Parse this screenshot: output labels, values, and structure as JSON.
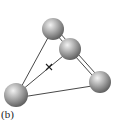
{
  "figure": {
    "label": "(b)",
    "atoms": [
      {
        "id": "top",
        "cx": 53,
        "cy": 29,
        "r": 11
      },
      {
        "id": "middle",
        "cx": 70,
        "cy": 49,
        "r": 11
      },
      {
        "id": "right",
        "cx": 100,
        "cy": 82,
        "r": 11
      },
      {
        "id": "bottom-left",
        "cx": 16,
        "cy": 95,
        "r": 12
      }
    ],
    "bonds": [
      {
        "from": "top",
        "to": "bottom-left",
        "type": "single"
      },
      {
        "from": "top",
        "to": "middle",
        "type": "double"
      },
      {
        "from": "middle",
        "to": "right",
        "type": "double"
      },
      {
        "from": "bottom-left",
        "to": "right",
        "type": "single"
      },
      {
        "from": "bottom-left",
        "to": "middle",
        "type": "single"
      }
    ],
    "center_marker": {
      "symbol": "x",
      "x": 49,
      "y": 67
    },
    "colors": {
      "bond": "#333333",
      "atom_light": "#e8e8e8",
      "atom_dark": "#6a6a6a"
    }
  }
}
